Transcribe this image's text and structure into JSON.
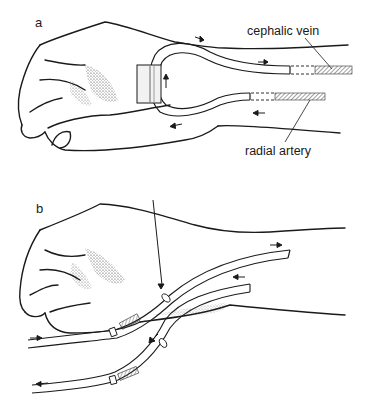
{
  "figure": {
    "panels": [
      {
        "id": "a",
        "letter": "a",
        "labels": {
          "vein": "cephalic vein",
          "artery": "radial artery"
        }
      },
      {
        "id": "b",
        "letter": "b"
      }
    ],
    "colors": {
      "ink": "#1a1a1a",
      "hatch": "#555555",
      "background": "#ffffff"
    }
  }
}
